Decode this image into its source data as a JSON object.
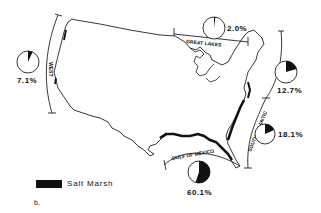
{
  "map": {
    "title": "Salt marsh distribution along US coasts",
    "panel_label": "b.",
    "legend": {
      "swatch_color": "#111111",
      "label": "Salt Marsh"
    },
    "regions": [
      {
        "name": "WEST",
        "percent": "7.1%",
        "value": 7.1
      },
      {
        "name": "GREAT LAKES",
        "percent": "2.0%",
        "value": 2.0
      },
      {
        "name": "NORTH ATLANTIC",
        "percent": "12.7%",
        "value": 12.7
      },
      {
        "name": "SOUTH ATLANTIC",
        "percent": "18.1%",
        "value": 18.1
      },
      {
        "name": "GULF OF MEXICO",
        "percent": "60.1%",
        "value": 60.1
      }
    ]
  }
}
